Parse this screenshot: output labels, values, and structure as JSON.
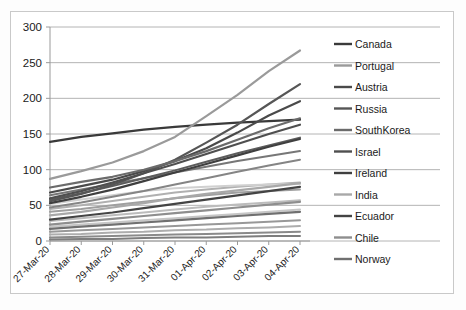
{
  "chart_data": {
    "type": "line",
    "title": "",
    "xlabel": "",
    "ylabel": "",
    "ylim": [
      0,
      300
    ],
    "yticks": [
      0,
      50,
      100,
      150,
      200,
      250,
      300
    ],
    "grid": true,
    "legend_position": "right",
    "x": [
      "27-Mar-20",
      "28-Mar-20",
      "29-Mar-20",
      "30-Mar-20",
      "31-Mar-20",
      "01-Apr-20",
      "02-Apr-20",
      "03-Apr-20",
      "04-Apr-20"
    ],
    "series": [
      {
        "name": "Canada",
        "color": "#3a3a3a",
        "values": [
          139,
          146,
          151,
          156,
          160,
          163,
          166,
          168,
          170
        ]
      },
      {
        "name": "Portugal",
        "color": "#9a9a9a",
        "values": [
          87,
          98,
          110,
          126,
          146,
          175,
          205,
          238,
          267
        ]
      },
      {
        "name": "Austria",
        "color": "#4a4a4a",
        "values": [
          68,
          77,
          86,
          98,
          112,
          130,
          152,
          176,
          196
        ]
      },
      {
        "name": "Russia",
        "color": "#565656",
        "values": [
          56,
          66,
          79,
          95,
          114,
          138,
          163,
          192,
          220
        ]
      },
      {
        "name": "SouthKorea",
        "color": "#6b6b6b",
        "values": [
          75,
          83,
          90,
          100,
          112,
          126,
          142,
          158,
          172
        ]
      },
      {
        "name": "Israel",
        "color": "#4f4f4f",
        "values": [
          60,
          70,
          82,
          95,
          108,
          122,
          136,
          150,
          163
        ]
      },
      {
        "name": "Ireland",
        "color": "#3f3f3f",
        "values": [
          53,
          62,
          72,
          84,
          96,
          108,
          120,
          132,
          143
        ]
      },
      {
        "name": "India",
        "color": "#a8a8a8",
        "values": [
          36,
          41,
          47,
          53,
          60,
          66,
          71,
          76,
          81
        ]
      },
      {
        "name": "Ecuador",
        "color": "#444444",
        "values": [
          30,
          35,
          40,
          46,
          52,
          58,
          64,
          70,
          76
        ]
      },
      {
        "name": "Chile",
        "color": "#8e8e8e",
        "values": [
          23,
          27,
          31,
          35,
          39,
          43,
          47,
          51,
          55
        ]
      },
      {
        "name": "Norway",
        "color": "#707070",
        "values": [
          17,
          20,
          23,
          26,
          29,
          32,
          35,
          38,
          41
        ]
      }
    ],
    "extra_series": [
      {
        "name": "cluster-a",
        "color": "#b0b0b0",
        "values": [
          45,
          50,
          56,
          62,
          68,
          72,
          76,
          79,
          82
        ]
      },
      {
        "name": "cluster-b",
        "color": "#9f9f9f",
        "values": [
          41,
          45,
          50,
          55,
          60,
          64,
          68,
          70,
          72
        ]
      },
      {
        "name": "cluster-c",
        "color": "#bcbcbc",
        "values": [
          28,
          32,
          36,
          40,
          44,
          48,
          51,
          54,
          57
        ]
      },
      {
        "name": "cluster-d",
        "color": "#c6c6c6",
        "values": [
          20,
          23,
          26,
          29,
          32,
          35,
          38,
          41,
          44
        ]
      },
      {
        "name": "cluster-e",
        "color": "#989898",
        "values": [
          13,
          15,
          17,
          19,
          21,
          23,
          25,
          27,
          29
        ]
      },
      {
        "name": "cluster-f",
        "color": "#adadad",
        "values": [
          9,
          10,
          12,
          13,
          15,
          16,
          18,
          19,
          21
        ]
      },
      {
        "name": "cluster-g",
        "color": "#8a8a8a",
        "values": [
          5,
          6,
          7,
          8,
          9,
          10,
          11,
          12,
          13
        ]
      },
      {
        "name": "cluster-h",
        "color": "#7d7d7d",
        "values": [
          2,
          3,
          3,
          4,
          5,
          5,
          6,
          7,
          7
        ]
      },
      {
        "name": "cluster-i",
        "color": "#d0d0d0",
        "values": [
          52,
          58,
          64,
          70,
          74,
          76,
          78,
          79,
          80
        ]
      },
      {
        "name": "cluster-j",
        "color": "#777777",
        "values": [
          64,
          72,
          80,
          88,
          96,
          104,
          112,
          119,
          126
        ]
      },
      {
        "name": "cluster-k",
        "color": "#5c5c5c",
        "values": [
          58,
          67,
          77,
          88,
          99,
          111,
          123,
          134,
          145
        ]
      },
      {
        "name": "cluster-l",
        "color": "#858585",
        "values": [
          47,
          54,
          62,
          70,
          79,
          88,
          97,
          106,
          114
        ]
      }
    ]
  },
  "legend": {
    "items": [
      {
        "label": "Canada"
      },
      {
        "label": "Portugal"
      },
      {
        "label": "Austria"
      },
      {
        "label": "Russia"
      },
      {
        "label": "SouthKorea"
      },
      {
        "label": "Israel"
      },
      {
        "label": "Ireland"
      },
      {
        "label": "India"
      },
      {
        "label": "Ecuador"
      },
      {
        "label": "Chile"
      },
      {
        "label": "Norway"
      }
    ]
  },
  "axes": {
    "y_tick_labels": [
      "300",
      "250",
      "200",
      "150",
      "100",
      "50",
      "0"
    ],
    "x_tick_labels": [
      "27-Mar-20",
      "28-Mar-20",
      "29-Mar-20",
      "30-Mar-20",
      "31-Mar-20",
      "01-Apr-20",
      "02-Apr-20",
      "03-Apr-20",
      "04-Apr-20"
    ]
  }
}
